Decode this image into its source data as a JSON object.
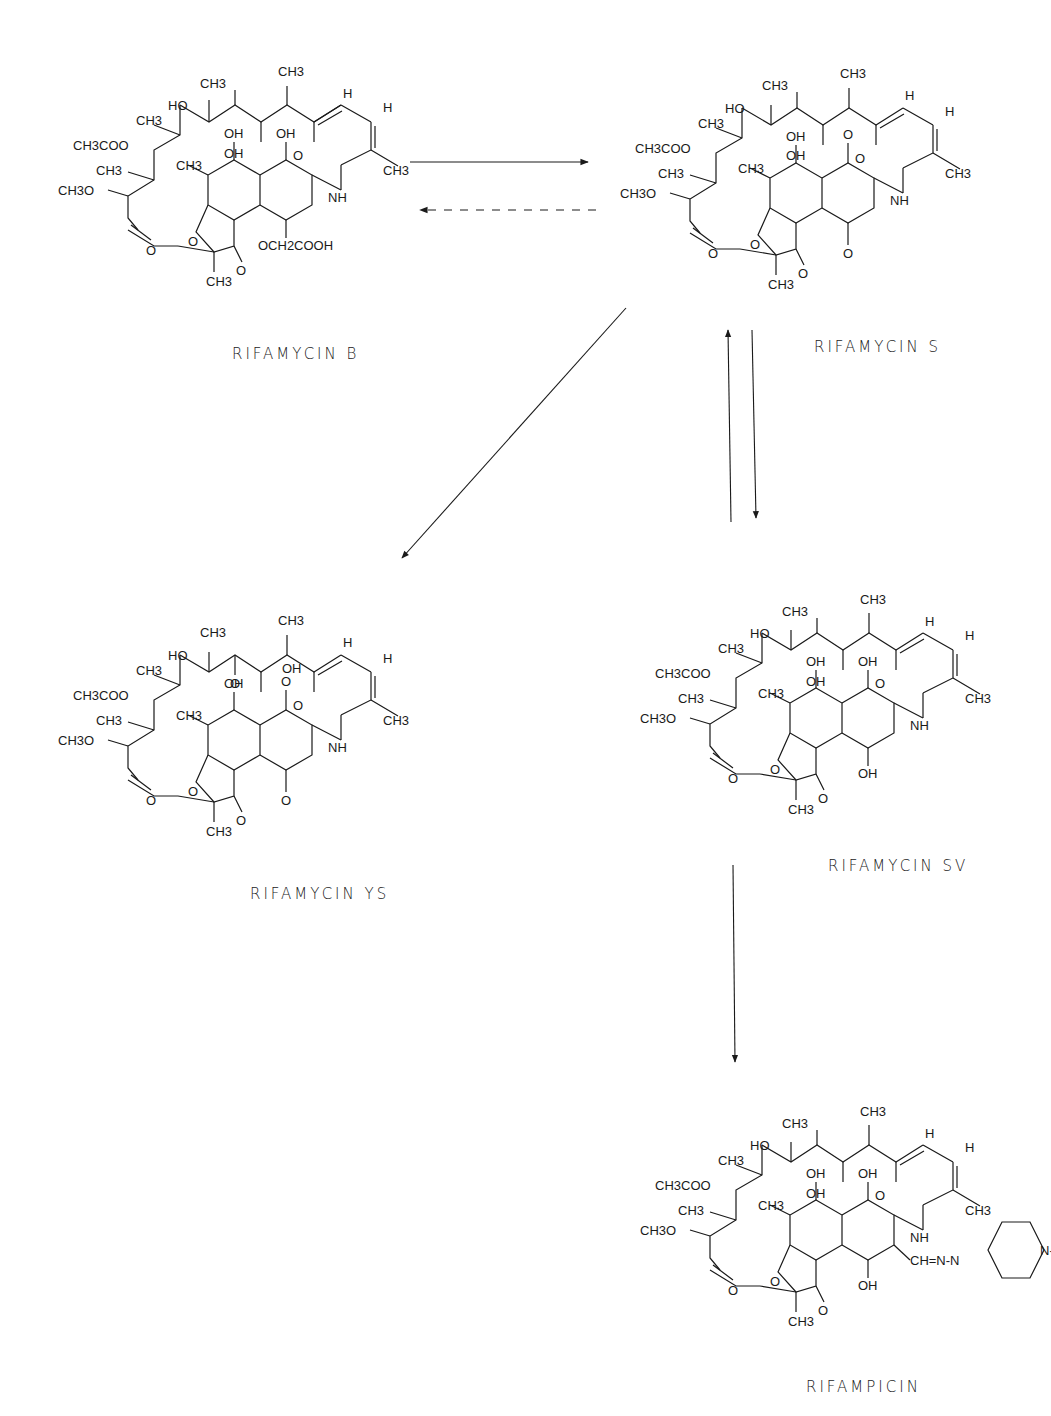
{
  "compounds": [
    {
      "id": "b",
      "name": "RIFAMYCIN B",
      "c1": "OH",
      "c4": "OCH2COOH",
      "c1_type": "hydroxyl",
      "c4_type": "ether",
      "c3_sub": "",
      "c20": "CH3",
      "c21": "OH",
      "c20_oh": ""
    },
    {
      "id": "s",
      "name": "RIFAMYCIN S",
      "c1": "O",
      "c4": "O",
      "c1_type": "keto",
      "c4_type": "keto",
      "c3_sub": "",
      "c20": "CH3",
      "c21": "OH",
      "c20_oh": ""
    },
    {
      "id": "ys",
      "name": "RIFAMYCIN YS",
      "c1": "O",
      "c4": "O",
      "c1_type": "keto",
      "c4_type": "keto",
      "c3_sub": "",
      "c20": "CH3",
      "c21": "O",
      "c20_oh": "OH"
    },
    {
      "id": "sv",
      "name": "RIFAMYCIN SV",
      "c1": "OH",
      "c4": "OH",
      "c1_type": "hydroxyl",
      "c4_type": "hydroxyl",
      "c3_sub": "",
      "c20": "CH3",
      "c21": "OH",
      "c20_oh": ""
    },
    {
      "id": "rif",
      "name": "RIFAMPICIN",
      "c1": "OH",
      "c4": "OH",
      "c1_type": "hydroxyl",
      "c4_type": "hydroxyl",
      "c3_sub": "CH=N-N",
      "piperazine_n": "N-CH3",
      "c20": "CH3",
      "c21": "OH",
      "c20_oh": ""
    }
  ],
  "common_labels": {
    "ho23": "HO",
    "ch3_22": "CH3",
    "ch3_20": "CH3",
    "h18": "H",
    "h17": "H",
    "ch3_24": "CH3",
    "acetoxy": "CH3COO",
    "ch3_26": "CH3",
    "methoxy": "CH3O",
    "ch3_16": "CH3",
    "o15": "O",
    "nh": "NH",
    "oh8": "OH",
    "ch3_14": "CH3",
    "o_ring": "O",
    "o29": "O",
    "o11": "O",
    "ch3_13": "CH3",
    "numbers": [
      "1",
      "2",
      "3",
      "4",
      "5",
      "6",
      "7",
      "8",
      "9",
      "10",
      "11",
      "12",
      "13",
      "14",
      "15",
      "16",
      "17",
      "18",
      "19",
      "20",
      "21",
      "22",
      "23",
      "24",
      "25",
      "26",
      "27",
      "28",
      "29"
    ]
  },
  "arrows": [
    {
      "from": "RIFAMYCIN B",
      "to": "RIFAMYCIN S",
      "style": "solid"
    },
    {
      "from": "RIFAMYCIN S",
      "to": "RIFAMYCIN B",
      "style": "dashed"
    },
    {
      "from": "RIFAMYCIN S",
      "to": "RIFAMYCIN YS",
      "style": "solid"
    },
    {
      "from": "RIFAMYCIN S",
      "to": "RIFAMYCIN SV",
      "style": "solid"
    },
    {
      "from": "RIFAMYCIN SV",
      "to": "RIFAMYCIN S",
      "style": "solid"
    },
    {
      "from": "RIFAMYCIN SV",
      "to": "RIFAMPICIN",
      "style": "solid"
    }
  ]
}
